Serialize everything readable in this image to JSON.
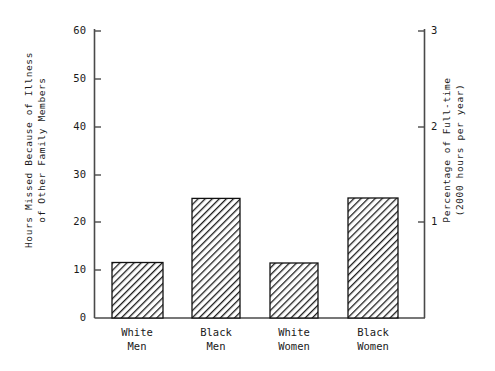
{
  "chart_data": {
    "type": "bar",
    "title": "",
    "subtitle": "",
    "categories": [
      "White Men",
      "Black Men",
      "White Women",
      "Black Women"
    ],
    "category_lines": [
      [
        "White",
        "Men"
      ],
      [
        "Black",
        "Men"
      ],
      [
        "White",
        "Women"
      ],
      [
        "Black",
        "Women"
      ]
    ],
    "values": [
      3.6,
      7.4,
      11.6,
      25.0
    ],
    "series": [
      {
        "name": "Hours Missed Because of Illness of Other Family Members",
        "values": [
          3.6,
          7.4,
          11.6,
          25.0
        ]
      }
    ],
    "xlabel": "",
    "ylabel": "Hours Missed Because of Illness of Other Family Members",
    "ylabel_lines": [
      "Hours Missed Because of Illness",
      "of Other Family Members"
    ],
    "ylim": [
      0,
      60
    ],
    "yticks": [
      0,
      10,
      20,
      30,
      40,
      50,
      60
    ],
    "ytick_labels": [
      "0",
      "10",
      "20",
      "30",
      "40",
      "50",
      "60"
    ],
    "y2label": "Percentage of Full-time (2000 hours per year)",
    "y2label_lines": [
      "Percentage of Full-time",
      "(2000 hours per year)"
    ],
    "y2lim": [
      0,
      3
    ],
    "y2ticks": [
      1,
      2,
      3
    ],
    "y2tick_labels": [
      "1",
      "2",
      "3"
    ],
    "grid": false,
    "legend": false,
    "legend_position": "none",
    "bar_style": {
      "fill": "hatch-diagonal",
      "edge_color": "#111111",
      "hatch_color": "#1a1a1a",
      "background": "#ffffff"
    },
    "axis_color": "#4a4a4a"
  }
}
